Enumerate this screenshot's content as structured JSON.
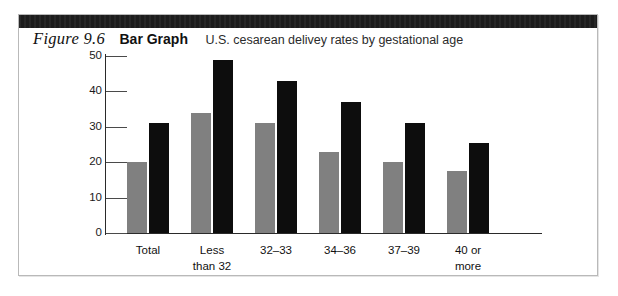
{
  "figure": {
    "number": "Figure 9.6",
    "kind": "Bar Graph",
    "subtitle": "U.S. cesarean delivey rates by gestational age"
  },
  "chart_data": {
    "type": "bar",
    "title": "U.S. cesarean delivey rates by gestational age",
    "xlabel": "",
    "ylabel": "",
    "ylim": [
      0,
      50
    ],
    "yticks": [
      "0",
      "10",
      "20",
      "30",
      "40",
      "50"
    ],
    "grid": false,
    "legend": "none",
    "categories": [
      "Total",
      "Less than 32",
      "32–33",
      "34–36",
      "37–39",
      "40 or more"
    ],
    "category_lines": [
      {
        "line1": "Total",
        "line2": ""
      },
      {
        "line1": "Less",
        "line2": "than 32"
      },
      {
        "line1": "32–33",
        "line2": ""
      },
      {
        "line1": "34–36",
        "line2": ""
      },
      {
        "line1": "37–39",
        "line2": ""
      },
      {
        "line1": "40 or",
        "line2": "more"
      }
    ],
    "series": [
      {
        "name": "gray",
        "color": "#808080",
        "values": [
          20,
          34,
          31,
          23,
          20,
          17.5
        ]
      },
      {
        "name": "black",
        "color": "#0d0d0d",
        "values": [
          31,
          49,
          43,
          37,
          31,
          25.5
        ]
      }
    ]
  }
}
